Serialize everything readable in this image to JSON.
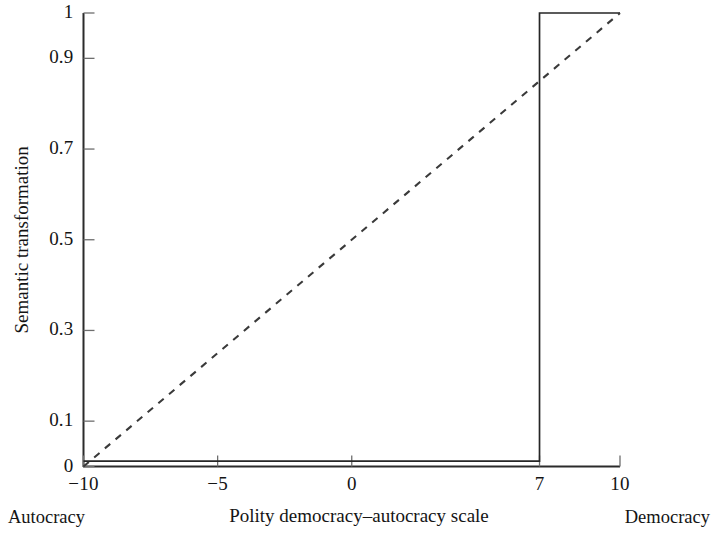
{
  "chart_data": {
    "type": "line",
    "title": "",
    "xlabel": "Polity democracy–autocracy scale",
    "ylabel": "Semantic transformation",
    "xlim": [
      -10,
      10
    ],
    "ylim": [
      0,
      1
    ],
    "grid": false,
    "legend": null,
    "xticks": [
      {
        "value": -10,
        "label": "−10"
      },
      {
        "value": -5,
        "label": "−5"
      },
      {
        "value": 0,
        "label": "0"
      },
      {
        "value": 7,
        "label": "7"
      },
      {
        "value": 10,
        "label": "10"
      }
    ],
    "yticks": [
      {
        "value": 0,
        "label": "0"
      },
      {
        "value": 0.1,
        "label": "0.1"
      },
      {
        "value": 0.3,
        "label": "0.3"
      },
      {
        "value": 0.5,
        "label": "0.5"
      },
      {
        "value": 0.7,
        "label": "0.7"
      },
      {
        "value": 0.9,
        "label": "0.9"
      },
      {
        "value": 1,
        "label": "1"
      }
    ],
    "annotations": [
      {
        "name": "left-pole",
        "text": "Autocracy",
        "x": -10
      },
      {
        "name": "right-pole",
        "text": "Democracy",
        "x": 10
      }
    ],
    "series": [
      {
        "name": "step-threshold",
        "style": "solid",
        "color": "#262626",
        "description": "Step function: 0 below the Polity score of 7, 1 at and above 7",
        "x": [
          -10,
          7,
          7,
          10
        ],
        "values": [
          0.012,
          0.012,
          1,
          1
        ]
      },
      {
        "name": "linear-rescaling",
        "style": "dashed",
        "color": "#3a3a3a",
        "description": "Linear transformation from Polity score to the 0–1 interval",
        "x": [
          -10,
          10
        ],
        "values": [
          0,
          1
        ]
      }
    ]
  },
  "axes": {
    "x_axis_name": "x-axis",
    "y_axis_name": "y-axis"
  }
}
